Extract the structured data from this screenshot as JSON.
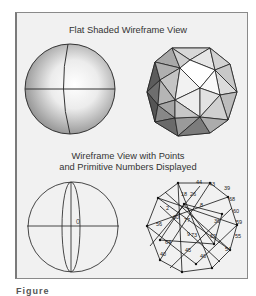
{
  "figure": {
    "top_title": "Flat Shaded Wireframe View",
    "bottom_title_line1": "Wireframe View with Points",
    "bottom_title_line2": "and Primitive Numbers Displayed",
    "left_wire_label": "0",
    "caption_partial": "Figure",
    "primitive_numbers": [
      "44",
      "43",
      "39",
      "68",
      "60",
      "59",
      "55",
      "54",
      "18",
      "26",
      "8",
      "2",
      "60",
      "77",
      "56",
      "73",
      "62",
      "64",
      "45",
      "46",
      "9",
      "40",
      "36"
    ]
  }
}
